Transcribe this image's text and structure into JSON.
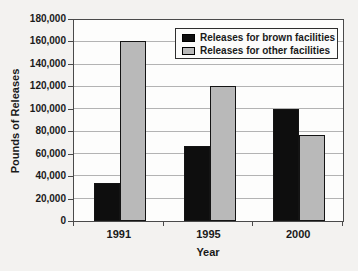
{
  "figure": {
    "background_color": "#f3f2f0",
    "plot_background_color": "#fdfdfc",
    "gridline_color": "#b3b3b3",
    "border_color": "#4a4a4a"
  },
  "chart_data": {
    "type": "bar",
    "title": "",
    "xlabel": "Year",
    "ylabel": "Pounds of Releases",
    "categories": [
      "1991",
      "1995",
      "2000"
    ],
    "series": [
      {
        "name": "Releases for brown facilities",
        "color": "#0e0e0e",
        "values": [
          34000,
          67000,
          100000
        ]
      },
      {
        "name": "Releases for other facilities",
        "color": "#b9b9b9",
        "values": [
          161000,
          121000,
          77000
        ]
      }
    ],
    "ylim": [
      0,
      180000
    ],
    "ytick_step": 20000,
    "ytick_labels": [
      "0",
      "20,000",
      "40,000",
      "60,000",
      "80,000",
      "100,000",
      "120,000",
      "140,000",
      "160,000",
      "180,000"
    ],
    "grid": true,
    "legend_position": "top-right"
  }
}
